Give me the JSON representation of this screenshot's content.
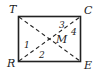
{
  "diagram": {
    "type": "rectangle-with-diagonals",
    "vertices": {
      "top_left": "T",
      "top_right": "C",
      "bottom_left": "R",
      "bottom_right": "E"
    },
    "intersection": "M",
    "angles": [
      "1",
      "2",
      "3",
      "4"
    ],
    "colors": {
      "stroke": "#222222",
      "background": "#ffffff"
    }
  }
}
